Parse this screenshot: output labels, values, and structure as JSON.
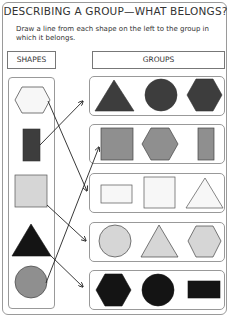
{
  "title": "DESCRIBING A GROUP—WHAT BELONGS?",
  "instructions": "Draw a line from each shape on the left to the group in which it belongs.",
  "headers": {
    "shapes": "SHAPES",
    "groups": "GROUPS"
  },
  "colors": {
    "dark": "#3d3d3d",
    "medium": "#8f8f8f",
    "light": "#d6d6d6",
    "white": "#f7f7f7",
    "black": "#141414",
    "stroke": "#444444"
  },
  "left_shapes": [
    {
      "shape": "hexagon",
      "fill": "white",
      "matches_group": 3
    },
    {
      "shape": "rectangle",
      "fill": "dark",
      "matches_group": 1
    },
    {
      "shape": "square",
      "fill": "light",
      "matches_group": 4
    },
    {
      "shape": "triangle",
      "fill": "black",
      "matches_group": 5
    },
    {
      "shape": "circle",
      "fill": "medium",
      "matches_group": 2
    }
  ],
  "groups": [
    {
      "id": 1,
      "fill": "dark",
      "shapes": [
        "triangle",
        "circle",
        "hexagon"
      ]
    },
    {
      "id": 2,
      "fill": "medium",
      "shapes": [
        "square",
        "hexagon",
        "rectangle"
      ]
    },
    {
      "id": 3,
      "fill": "white",
      "shapes": [
        "rectangle",
        "square",
        "triangle"
      ]
    },
    {
      "id": 4,
      "fill": "light",
      "shapes": [
        "circle",
        "triangle",
        "hexagon"
      ]
    },
    {
      "id": 5,
      "fill": "black",
      "shapes": [
        "hexagon",
        "circle",
        "rectangle"
      ]
    }
  ]
}
